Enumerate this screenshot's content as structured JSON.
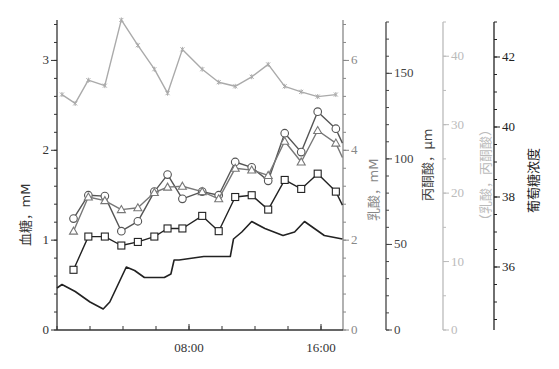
{
  "chart_data": {
    "type": "line",
    "title": "",
    "xlabel": "",
    "x_ticks": [
      {
        "hour": 8,
        "label": "08:00"
      },
      {
        "hour": 16,
        "label": "16:00"
      }
    ],
    "x_range_hours": [
      0,
      17.4
    ],
    "x_minor_tick_step_hours": 2,
    "grid": false,
    "legend": "none",
    "axes": [
      {
        "id": "blood",
        "title": "血糖，mM",
        "side": "left",
        "range": [
          0,
          3.45
        ],
        "ticks": [
          0,
          1,
          2,
          3
        ],
        "minor_step": 0.2,
        "color": "#333333"
      },
      {
        "id": "lactate",
        "title": "乳酸，mM",
        "side": "right",
        "range": [
          0,
          6.9
        ],
        "ticks": [
          0,
          2,
          4,
          6
        ],
        "minor_step": 0.4,
        "color": "#888888"
      },
      {
        "id": "pyruvate",
        "title": "丙酮酸，μm",
        "side": "right",
        "range": [
          0,
          180
        ],
        "ticks": [
          0,
          50,
          100,
          150
        ],
        "minor_step": 10,
        "color": "#444444"
      },
      {
        "id": "ratio",
        "title": "（乳酸，丙酮酸）",
        "side": "right",
        "range": [
          0,
          45
        ],
        "ticks": [
          0,
          10,
          20,
          30,
          40
        ],
        "minor_step": 5,
        "color": "#bbbbbb"
      },
      {
        "id": "glucose",
        "title": "葡萄糖浓度",
        "side": "right",
        "range": [
          34.2,
          43
        ],
        "ticks": [
          36,
          38,
          40,
          42
        ],
        "minor_step": 0.5,
        "color": "#222222"
      }
    ],
    "series": [
      {
        "name": "stars",
        "axis": "ratio",
        "marker": "star",
        "color": "#aaaaaa",
        "x": [
          0.3,
          1.1,
          1.9,
          2.9,
          3.9,
          4.9,
          5.9,
          6.7,
          7.6,
          8.8,
          9.8,
          10.8,
          11.8,
          12.8,
          13.8,
          14.8,
          15.8,
          16.9
        ],
        "values": [
          34.4,
          33.1,
          36.5,
          35.7,
          45.3,
          41.6,
          38.1,
          34.6,
          41.0,
          38.1,
          36.2,
          35.6,
          37.0,
          38.8,
          35.6,
          34.8,
          34.1,
          34.4
        ]
      },
      {
        "name": "circles",
        "axis": "blood",
        "marker": "circle",
        "color": "#555555",
        "x": [
          1.0,
          1.9,
          2.9,
          3.9,
          4.9,
          5.9,
          6.7,
          7.6,
          8.8,
          9.8,
          10.8,
          11.8,
          12.8,
          13.8,
          14.8,
          15.8,
          16.9,
          17.3
        ],
        "values": [
          1.24,
          1.5,
          1.49,
          1.1,
          1.21,
          1.54,
          1.73,
          1.46,
          1.54,
          1.5,
          1.87,
          1.81,
          1.66,
          2.19,
          1.98,
          2.43,
          2.24,
          2.08
        ]
      },
      {
        "name": "triangles",
        "axis": "blood",
        "marker": "triangle",
        "color": "#777777",
        "x": [
          1.0,
          1.9,
          2.9,
          3.9,
          4.9,
          5.9,
          6.7,
          7.6,
          8.8,
          9.8,
          10.8,
          11.8,
          12.8,
          13.8,
          14.8,
          15.8,
          16.9,
          17.3
        ],
        "values": [
          1.1,
          1.48,
          1.44,
          1.34,
          1.36,
          1.53,
          1.59,
          1.6,
          1.54,
          1.46,
          1.8,
          1.78,
          1.72,
          2.1,
          1.87,
          2.22,
          2.08,
          1.92
        ]
      },
      {
        "name": "squares",
        "axis": "blood",
        "marker": "square",
        "color": "#222222",
        "x": [
          1.0,
          1.9,
          2.9,
          3.9,
          4.9,
          5.9,
          6.7,
          7.6,
          8.8,
          9.8,
          10.8,
          11.8,
          12.8,
          13.8,
          14.8,
          15.8,
          16.9,
          17.3
        ],
        "values": [
          0.67,
          1.04,
          1.04,
          0.94,
          0.98,
          1.04,
          1.13,
          1.13,
          1.27,
          1.1,
          1.48,
          1.5,
          1.34,
          1.67,
          1.57,
          1.74,
          1.54,
          1.39
        ]
      },
      {
        "name": "continuous",
        "axis": "glucose",
        "marker": "none",
        "color": "#222222",
        "x": [
          0.0,
          0.3,
          1.1,
          2.0,
          2.8,
          3.2,
          3.8,
          4.2,
          4.7,
          5.3,
          5.9,
          6.5,
          6.9,
          7.1,
          7.4,
          8.9,
          10.5,
          10.7,
          11.2,
          11.8,
          12.6,
          13.7,
          14.4,
          15.0,
          15.6,
          16.2,
          17.3
        ],
        "values": [
          35.4,
          35.5,
          35.3,
          35.0,
          34.8,
          35.0,
          35.6,
          36.0,
          35.9,
          35.7,
          35.7,
          35.7,
          35.8,
          36.2,
          36.2,
          36.3,
          36.3,
          36.8,
          37.0,
          37.3,
          37.1,
          36.9,
          37.0,
          37.3,
          37.1,
          36.9,
          36.8
        ]
      }
    ]
  }
}
